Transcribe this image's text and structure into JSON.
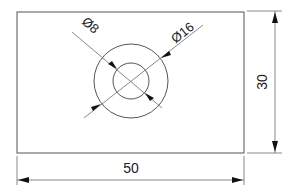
{
  "drawing": {
    "part": {
      "width_label": "50",
      "height_label": "30"
    },
    "holes": {
      "inner_diameter_label": "Ø8",
      "outer_diameter_label": "Ø16"
    },
    "colors": {
      "line": "#555555",
      "arrow": "#111111",
      "text": "#222222",
      "background": "#ffffff"
    }
  }
}
